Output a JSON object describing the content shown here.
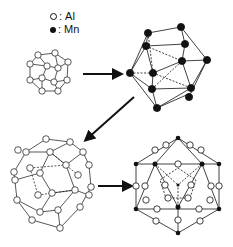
{
  "legend": {
    "items": [
      {
        "symbol": "open-circle",
        "sep": ":",
        "label": "Al"
      },
      {
        "symbol": "filled-circle",
        "sep": ":",
        "label": "Mn"
      }
    ]
  },
  "colors": {
    "line": "#111111",
    "al_fill": "#ffffff",
    "mn_fill": "#111111",
    "background": "#ffffff"
  },
  "clusters": [
    {
      "id": "small-al-icosahedron",
      "atom": "Al"
    },
    {
      "id": "mn-icosahedron",
      "atom": "Mn"
    },
    {
      "id": "al-icosidodecahedron",
      "atom": "Al"
    },
    {
      "id": "combined-mackay-cluster",
      "atom": "Al+Mn"
    }
  ],
  "arrows": [
    {
      "from": "small-al-icosahedron",
      "to": "mn-icosahedron",
      "direction": "right"
    },
    {
      "from": "mn-icosahedron",
      "to": "al-icosidodecahedron",
      "direction": "down-left"
    },
    {
      "from": "al-icosidodecahedron",
      "to": "combined-mackay-cluster",
      "direction": "right"
    }
  ]
}
